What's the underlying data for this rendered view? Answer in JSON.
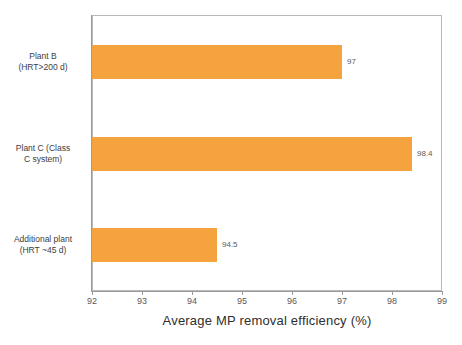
{
  "chart_data": {
    "type": "bar",
    "orientation": "horizontal",
    "title": "",
    "xlabel": "Average MP removal efficiency (%)",
    "ylabel": "",
    "xlim": [
      92,
      99
    ],
    "xticks": [
      "92",
      "93",
      "94",
      "95",
      "96",
      "97",
      "98",
      "99"
    ],
    "grid": false,
    "legend": null,
    "categories": [
      "Plant B (HRT>200 d)",
      "Plant C (Class C system)",
      "Additional plant (HRT ~45 d)"
    ],
    "category_lines": [
      [
        "Plant B",
        "(HRT>200 d)"
      ],
      [
        "Plant C (Class",
        "C system)"
      ],
      [
        "Additional plant",
        "(HRT ~45 d)"
      ]
    ],
    "values": [
      97,
      98.4,
      94.5
    ],
    "value_labels": [
      "97",
      "98.4",
      "94.5"
    ],
    "bar_color": "#F5A33F",
    "frame_color": "#b9b9b9",
    "text_color": "#4a4a4a"
  }
}
